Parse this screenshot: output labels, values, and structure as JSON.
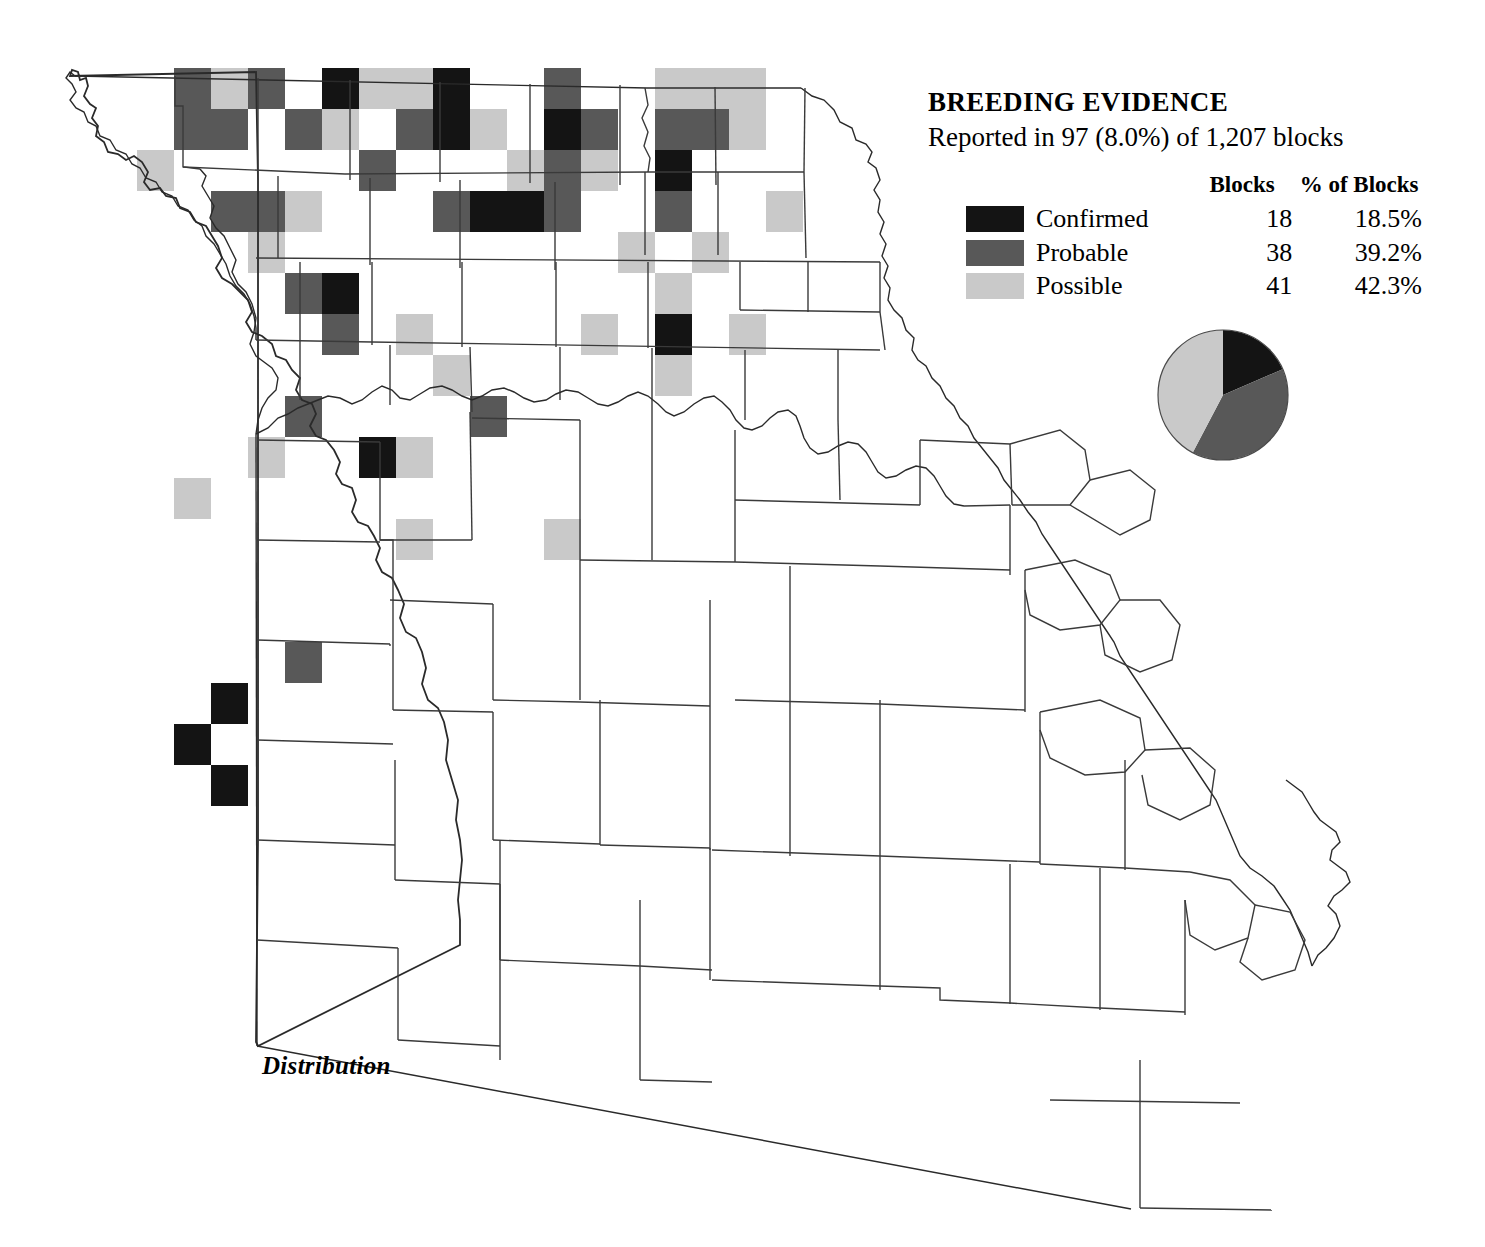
{
  "legend": {
    "title": "BREEDING EVIDENCE",
    "subtitle": "Reported in 97 (8.0%) of 1,207 blocks",
    "header_blocks": "Blocks",
    "header_percent": "% of Blocks",
    "rows": [
      {
        "swatch": "confirmed-swatch",
        "label": "Confirmed",
        "blocks": "18",
        "percent": "18.5%",
        "color": "#141414"
      },
      {
        "swatch": "probable-swatch",
        "label": "Probable",
        "blocks": "38",
        "percent": "39.2%",
        "color": "#585858"
      },
      {
        "swatch": "possible-swatch",
        "label": "Possible",
        "blocks": "41",
        "percent": "42.3%",
        "color": "#c9c9c9"
      }
    ]
  },
  "caption": {
    "distribution_label": "Distribution"
  },
  "chart_data": {
    "type": "pie",
    "title": "BREEDING EVIDENCE",
    "subtitle": "Reported in 97 (8.0%) of 1,207 blocks",
    "total_blocks": 1207,
    "reported_blocks": 97,
    "reported_percent": 8.0,
    "categories": [
      "Confirmed",
      "Probable",
      "Possible"
    ],
    "values": [
      18,
      38,
      41
    ],
    "percentages": [
      18.5,
      39.2,
      42.3
    ],
    "colors": [
      "#141414",
      "#585858",
      "#c9c9c9"
    ],
    "start_angle_deg": 0,
    "direction": "clockwise",
    "legend_position": "top-right",
    "grid": false
  },
  "map": {
    "name": "missouri-breeding-evidence-map",
    "block_grid": {
      "cell_width": 37,
      "cell_height": 41,
      "origin_x": 63,
      "origin_y": 68
    },
    "blocks": [
      {
        "c": 3,
        "r": 0,
        "w": 1,
        "h": 2,
        "v": "probable"
      },
      {
        "c": 4,
        "r": 0,
        "v": "possible"
      },
      {
        "c": 4,
        "r": 1,
        "v": "probable"
      },
      {
        "c": 5,
        "r": 0,
        "v": "probable"
      },
      {
        "c": 7,
        "r": 0,
        "v": "confirmed"
      },
      {
        "c": 8,
        "r": 0,
        "v": "possible"
      },
      {
        "c": 9,
        "r": 0,
        "v": "possible"
      },
      {
        "c": 10,
        "r": 0,
        "v": "confirmed"
      },
      {
        "c": 13,
        "r": 0,
        "v": "probable"
      },
      {
        "c": 6,
        "r": 1,
        "v": "probable"
      },
      {
        "c": 7,
        "r": 1,
        "v": "possible"
      },
      {
        "c": 9,
        "r": 1,
        "v": "probable"
      },
      {
        "c": 10,
        "r": 1,
        "v": "confirmed"
      },
      {
        "c": 11,
        "r": 1,
        "v": "possible"
      },
      {
        "c": 13,
        "r": 1,
        "v": "confirmed"
      },
      {
        "c": 14,
        "r": 1,
        "v": "probable"
      },
      {
        "c": 2,
        "r": 2,
        "v": "possible"
      },
      {
        "c": 8,
        "r": 2,
        "v": "probable"
      },
      {
        "c": 12,
        "r": 2,
        "v": "possible"
      },
      {
        "c": 13,
        "r": 2,
        "v": "probable"
      },
      {
        "c": 14,
        "r": 2,
        "v": "possible"
      },
      {
        "c": 4,
        "r": 3,
        "v": "probable"
      },
      {
        "c": 5,
        "r": 3,
        "v": "probable"
      },
      {
        "c": 6,
        "r": 3,
        "v": "possible"
      },
      {
        "c": 10,
        "r": 3,
        "v": "probable"
      },
      {
        "c": 11,
        "r": 3,
        "v": "confirmed"
      },
      {
        "c": 12,
        "r": 3,
        "v": "confirmed"
      },
      {
        "c": 13,
        "r": 3,
        "v": "probable"
      },
      {
        "c": 5,
        "r": 4,
        "v": "possible"
      },
      {
        "c": 15,
        "r": 4,
        "v": "probable"
      },
      {
        "c": 6,
        "r": 5,
        "v": "probable"
      },
      {
        "c": 7,
        "r": 5,
        "v": "confirmed"
      },
      {
        "c": 7,
        "r": 6,
        "v": "probable"
      },
      {
        "c": 9,
        "r": 6,
        "v": "possible"
      },
      {
        "c": 10,
        "r": 7,
        "v": "possible"
      },
      {
        "c": 6,
        "r": 8,
        "v": "probable"
      },
      {
        "c": 5,
        "r": 9,
        "v": "possible"
      },
      {
        "c": 8,
        "r": 9,
        "v": "confirmed"
      },
      {
        "c": 16,
        "r": 0,
        "v": "possible"
      },
      {
        "c": 17,
        "r": 0,
        "v": "possible"
      },
      {
        "c": 18,
        "r": 0,
        "v": "possible"
      },
      {
        "c": 16,
        "r": 1,
        "v": "probable"
      },
      {
        "c": 17,
        "r": 1,
        "v": "probable"
      },
      {
        "c": 18,
        "r": 1,
        "v": "possible"
      },
      {
        "c": 16,
        "r": 2,
        "v": "confirmed"
      },
      {
        "c": 16,
        "r": 3,
        "v": "probable"
      },
      {
        "c": 19,
        "r": 3,
        "v": "possible"
      },
      {
        "c": 15,
        "r": 4,
        "v": "possible"
      },
      {
        "c": 17,
        "r": 4,
        "v": "possible"
      },
      {
        "c": 16,
        "r": 5,
        "v": "possible"
      },
      {
        "c": 16,
        "r": 6,
        "v": "confirmed"
      },
      {
        "c": 18,
        "r": 6,
        "v": "possible"
      },
      {
        "c": 14,
        "r": 6,
        "v": "possible"
      },
      {
        "c": 16,
        "r": 7,
        "v": "possible"
      },
      {
        "c": 3,
        "r": 10,
        "v": "possible"
      },
      {
        "c": 9,
        "r": 9,
        "v": "possible"
      },
      {
        "c": 9,
        "r": 11,
        "v": "possible"
      },
      {
        "c": 6,
        "r": 14,
        "v": "probable"
      },
      {
        "c": 4,
        "r": 15,
        "v": "confirmed"
      },
      {
        "c": 3,
        "r": 16,
        "v": "confirmed"
      },
      {
        "c": 4,
        "r": 17,
        "v": "confirmed"
      },
      {
        "c": 13,
        "r": 11,
        "v": "possible"
      },
      {
        "c": 11,
        "r": 8,
        "v": "probable"
      }
    ]
  }
}
